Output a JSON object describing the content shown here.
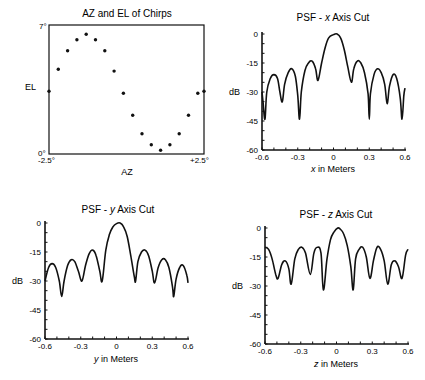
{
  "chart_data": [
    {
      "id": "azel",
      "type": "scatter",
      "title": "AZ and EL of Chirps",
      "xlabel": "AZ",
      "ylabel": "EL",
      "x_tick_labels": [
        "-2.5°",
        "+2.5°"
      ],
      "y_tick_labels": [
        "0°",
        "7°"
      ],
      "xlim": [
        -2.5,
        2.5
      ],
      "ylim": [
        0,
        7
      ],
      "frame": true,
      "x": [
        -2.5,
        -2.2,
        -1.9,
        -1.6,
        -1.3,
        -1.0,
        -0.7,
        -0.4,
        -0.1,
        0.2,
        0.5,
        0.8,
        1.1,
        1.4,
        1.7,
        2.0,
        2.3,
        2.5
      ],
      "y": [
        3.4,
        4.6,
        5.6,
        6.2,
        6.5,
        6.2,
        5.6,
        4.5,
        3.3,
        2.1,
        1.1,
        0.5,
        0.2,
        0.5,
        1.1,
        2.1,
        3.3,
        3.4
      ]
    },
    {
      "id": "xcut",
      "type": "line",
      "title_prefix": "PSF - ",
      "title_var": "x",
      "title_suffix": " Axis Cut",
      "xlabel_var": "x",
      "xlabel_suffix": " in Meters",
      "ylabel": "dB",
      "x_ticks": [
        "-0.6",
        "-0.3",
        "0",
        "0.3",
        "0.6"
      ],
      "y_ticks": [
        "0",
        "-15",
        "-30",
        "-45",
        "-60"
      ],
      "xlim": [
        -0.6,
        0.6
      ],
      "ylim": [
        -60,
        0
      ],
      "x": [
        -0.6,
        -0.59,
        -0.575,
        -0.56,
        -0.53,
        -0.5,
        -0.47,
        -0.45,
        -0.43,
        -0.41,
        -0.38,
        -0.35,
        -0.32,
        -0.3,
        -0.285,
        -0.27,
        -0.24,
        -0.21,
        -0.18,
        -0.15,
        -0.13,
        -0.1,
        -0.07,
        -0.04,
        0.0,
        0.03,
        0.06,
        0.09,
        0.12,
        0.15,
        0.17,
        0.2,
        0.23,
        0.26,
        0.29,
        0.3,
        0.31,
        0.34,
        0.37,
        0.4,
        0.43,
        0.45,
        0.47,
        0.5,
        0.53,
        0.56,
        0.575,
        0.59,
        0.6
      ],
      "y": [
        -30,
        -36,
        -44,
        -30,
        -23,
        -21,
        -23,
        -30,
        -35,
        -26,
        -20,
        -18,
        -22,
        -32,
        -44,
        -30,
        -19,
        -15,
        -14,
        -18,
        -24,
        -15,
        -7,
        -2,
        -0.3,
        0,
        -2,
        -8,
        -17,
        -25,
        -18,
        -14,
        -15,
        -20,
        -31,
        -44,
        -31,
        -21,
        -18,
        -20,
        -26,
        -36,
        -27,
        -21,
        -23,
        -33,
        -44,
        -32,
        -28
      ]
    },
    {
      "id": "ycut",
      "type": "line",
      "title_prefix": "PSF - ",
      "title_var": "y",
      "title_suffix": " Axis Cut",
      "xlabel_var": "y",
      "xlabel_suffix": " in Meters",
      "ylabel": "dB",
      "x_ticks": [
        "-0.6",
        "-0.3",
        "0",
        "0.3",
        "0.6"
      ],
      "y_ticks": [
        "0",
        "-15",
        "-30",
        "-45",
        "-60"
      ],
      "xlim": [
        -0.6,
        0.6
      ],
      "ylim": [
        -60,
        0
      ],
      "x": [
        -0.6,
        -0.57,
        -0.54,
        -0.51,
        -0.48,
        -0.46,
        -0.44,
        -0.41,
        -0.38,
        -0.35,
        -0.32,
        -0.29,
        -0.26,
        -0.23,
        -0.2,
        -0.17,
        -0.14,
        -0.12,
        -0.09,
        -0.06,
        -0.03,
        0.0,
        0.03,
        0.06,
        0.09,
        0.12,
        0.15,
        0.16,
        0.18,
        0.21,
        0.24,
        0.27,
        0.3,
        0.32,
        0.35,
        0.38,
        0.41,
        0.44,
        0.47,
        0.48,
        0.5,
        0.53,
        0.56,
        0.59,
        0.6
      ],
      "y": [
        -30,
        -23,
        -21,
        -23,
        -30,
        -38,
        -30,
        -22,
        -19,
        -20,
        -25,
        -30,
        -22,
        -16,
        -14,
        -17,
        -25,
        -30,
        -14,
        -6,
        -2,
        -0.3,
        0,
        -2,
        -7,
        -17,
        -28,
        -30,
        -20,
        -15,
        -14,
        -17,
        -25,
        -31,
        -23,
        -19,
        -19,
        -23,
        -33,
        -38,
        -29,
        -23,
        -22,
        -27,
        -31
      ]
    },
    {
      "id": "zcut",
      "type": "line",
      "title_prefix": "PSF - ",
      "title_var": "z",
      "title_suffix": " Axis Cut",
      "xlabel_var": "z",
      "xlabel_suffix": " in Meters",
      "ylabel": "dB",
      "x_ticks": [
        "-0.6",
        "-0.3",
        "0",
        "0.3",
        "0.6"
      ],
      "y_ticks": [
        "0",
        "-15",
        "-30",
        "-45",
        "-60"
      ],
      "xlim": [
        -0.6,
        0.6
      ],
      "ylim": [
        -60,
        0
      ],
      "x": [
        -0.6,
        -0.57,
        -0.54,
        -0.51,
        -0.49,
        -0.46,
        -0.43,
        -0.4,
        -0.38,
        -0.35,
        -0.32,
        -0.29,
        -0.26,
        -0.22,
        -0.19,
        -0.16,
        -0.13,
        -0.11,
        -0.08,
        -0.05,
        -0.02,
        0.01,
        0.03,
        0.06,
        0.09,
        0.12,
        0.14,
        0.16,
        0.19,
        0.22,
        0.25,
        0.28,
        0.31,
        0.34,
        0.37,
        0.4,
        0.43,
        0.46,
        0.49,
        0.52,
        0.55,
        0.58,
        0.6
      ],
      "y": [
        -10,
        -11,
        -16,
        -24,
        -26,
        -19,
        -17,
        -21,
        -29,
        -16,
        -11,
        -10,
        -13,
        -24,
        -13,
        -10,
        -13,
        -32,
        -16,
        -6,
        -2,
        0,
        -0.5,
        -3,
        -9,
        -20,
        -32,
        -16,
        -11,
        -10,
        -15,
        -26,
        -17,
        -10,
        -11,
        -17,
        -29,
        -19,
        -17,
        -20,
        -26,
        -14,
        -11
      ]
    }
  ]
}
